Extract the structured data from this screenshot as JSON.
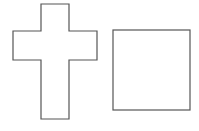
{
  "diagram": {
    "background": "#ffffff",
    "stroke_color": "#555555",
    "shapes": [
      {
        "type": "cross",
        "points": "41,4 69,4 69,31 97,31 97,60 69,60 69,119 41,119 41,60 13,60 13,31 41,31"
      },
      {
        "type": "square",
        "x": 113,
        "y": 30,
        "width": 77,
        "height": 80
      }
    ]
  }
}
